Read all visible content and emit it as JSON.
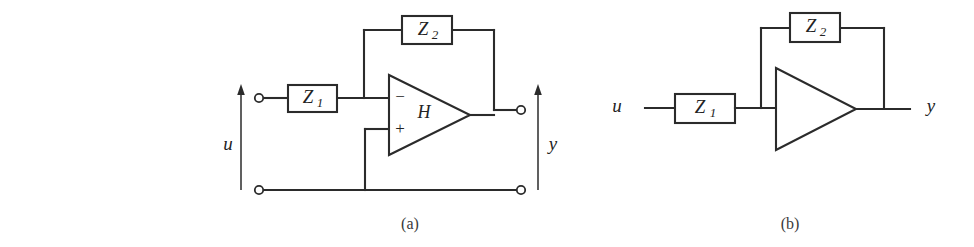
{
  "figure": {
    "background_color": "#ffffff",
    "ink_color": "#2b2b2b",
    "panels": [
      {
        "id": "panel-a",
        "caption": "(a)",
        "description": "Inverting operational amplifier circuit with input impedance Z1 and feedback impedance Z2, two-port terminals for u and y",
        "components": {
          "input_impedance_label": "Z",
          "input_impedance_subscript": "1",
          "feedback_impedance_label": "Z",
          "feedback_impedance_subscript": "2",
          "amplifier_label": "H",
          "inverting_input_sign": "−",
          "noninverting_input_sign": "+",
          "input_port_label": "u",
          "output_port_label": "y"
        }
      },
      {
        "id": "panel-b",
        "caption": "(b)",
        "description": "Simplified single-ended block diagram with series impedance Z1, amplifier triangle and feedback impedance Z2",
        "components": {
          "input_impedance_label": "Z",
          "input_impedance_subscript": "1",
          "feedback_impedance_label": "Z",
          "feedback_impedance_subscript": "2",
          "input_port_label": "u",
          "output_port_label": "y"
        }
      }
    ]
  }
}
